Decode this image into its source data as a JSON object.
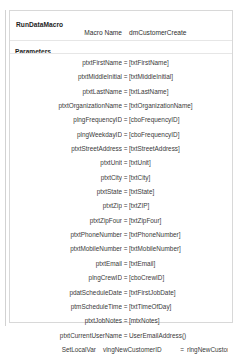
{
  "block": {
    "title": "RunDataMacro",
    "macro_name_label": "Macro Name",
    "macro_name_value": "dmCustomerCreate",
    "parameters_label": "Parameters",
    "equals": "="
  },
  "parameters": [
    {
      "label": "ptxtFirstName",
      "value": "[txtFirstName]"
    },
    {
      "label": "ptxtMiddleInitial",
      "value": "[txtMiddleInitial]"
    },
    {
      "label": "ptxtLastName",
      "value": "[txtLastName]"
    },
    {
      "label": "ptxtOrganizationName",
      "value": "[txtOrganizationName]"
    },
    {
      "label": "plngFrequencyID",
      "value": "[cboFrequencyID]"
    },
    {
      "label": "plngWeekdayID",
      "value": "[cboFrequencyID]"
    },
    {
      "label": "ptxtStreetAddress",
      "value": "[txtStreetAddress]"
    },
    {
      "label": "ptxtUnit",
      "value": "[txtUnit]"
    },
    {
      "label": "ptxtCity",
      "value": "[txtCity]"
    },
    {
      "label": "ptxtState",
      "value": "[txtState]"
    },
    {
      "label": "ptxtZip",
      "value": "[txtZIP]"
    },
    {
      "label": "ptxtZipFour",
      "value": "[txtZipFour]"
    },
    {
      "label": "ptxtPhoneNumber",
      "value": "[txtPhoneNumber]"
    },
    {
      "label": "ptxtMobileNumber",
      "value": "[txtMobileNumber]"
    },
    {
      "label": "ptxtEmail",
      "value": "[txtEmail]"
    },
    {
      "label": "plngCrewID",
      "value": "[cboCrewID]"
    },
    {
      "label": "pdatScheduleDate",
      "value": "[txtFirstJobDate]"
    },
    {
      "label": "ptmScheduleTime",
      "value": "[txtTimeOfDay]"
    },
    {
      "label": "ptxtJobNotes",
      "value": "[mtxNotes]"
    },
    {
      "label": "ptxtCurrentUserName",
      "value": "UserEmailAddress()"
    }
  ],
  "set_local_var": {
    "action": "SetLocalVar",
    "variable": "vlngNewCustomerID",
    "equals": "=",
    "expression": "rlngNewCustomerID"
  }
}
